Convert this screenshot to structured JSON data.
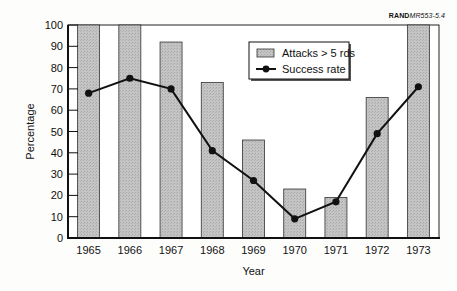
{
  "source_tag": {
    "bold": "RAND",
    "italic": "MR553-5.4"
  },
  "chart_data": {
    "type": "bar",
    "title": "",
    "xlabel": "Year",
    "ylabel": "Percentage",
    "ylim": [
      0,
      100
    ],
    "yticks": [
      0,
      10,
      20,
      30,
      40,
      50,
      60,
      70,
      80,
      90,
      100
    ],
    "grid": false,
    "legend_position": "upper center",
    "categories": [
      "1965",
      "1966",
      "1967",
      "1968",
      "1969",
      "1970",
      "1971",
      "1972",
      "1973"
    ],
    "series": [
      {
        "name": "Attacks > 5 rds",
        "type": "bar",
        "color": "#bdbdbd",
        "values": [
          100,
          100,
          92,
          73,
          46,
          23,
          19,
          66,
          100
        ]
      },
      {
        "name": "Success rate",
        "type": "line",
        "color": "#111111",
        "marker": "circle",
        "values": [
          68,
          75,
          70,
          41,
          27,
          9,
          17,
          49,
          71
        ]
      }
    ]
  }
}
